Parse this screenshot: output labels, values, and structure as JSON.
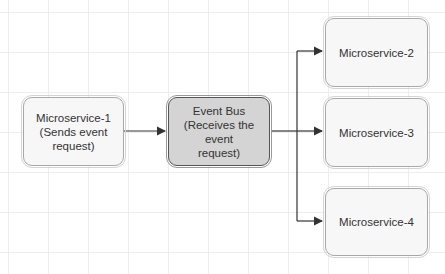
{
  "diagram": {
    "nodes": [
      {
        "id": "ms1",
        "label": "Microservice-1\n(Sends event\nrequest)"
      },
      {
        "id": "bus",
        "label": "Event Bus\n(Receives the event\nrequest)"
      },
      {
        "id": "ms2",
        "label": "Microservice-2"
      },
      {
        "id": "ms3",
        "label": "Microservice-3"
      },
      {
        "id": "ms4",
        "label": "Microservice-4"
      }
    ],
    "edges": [
      {
        "from": "ms1",
        "to": "bus"
      },
      {
        "from": "bus",
        "to": "ms2"
      },
      {
        "from": "bus",
        "to": "ms3"
      },
      {
        "from": "bus",
        "to": "ms4"
      }
    ],
    "colors": {
      "bus_fill": "#d4d4d4",
      "node_fill": "#f7f7f7",
      "edge": "#333333"
    }
  }
}
